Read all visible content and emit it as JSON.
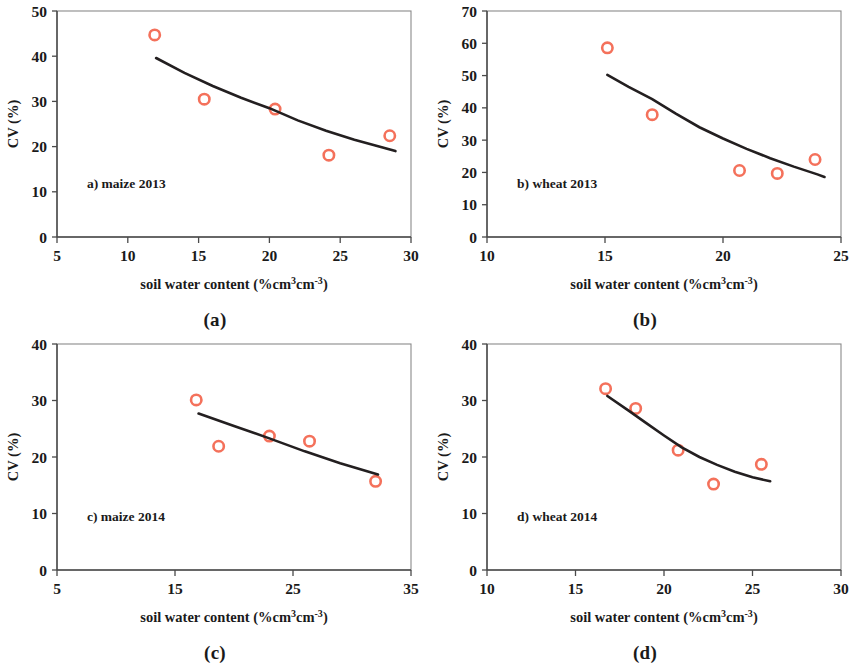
{
  "figure": {
    "marker_color": "#F4715B",
    "curve_color": "#231f20",
    "axis_color": "#4a4a4a",
    "frame_color": "#8a8a8a",
    "xlabel": "soil water content (%cm³cm⁻³)",
    "ylabel": "CV (%)"
  },
  "panels": [
    {
      "caption": "(a)",
      "tag": "a) maize 2013",
      "chart_data": {
        "type": "scatter",
        "title": "a) maize 2013",
        "xlabel": "soil water content (%cm³cm⁻³)",
        "ylabel": "CV (%)",
        "xlim": [
          5,
          30
        ],
        "ylim": [
          0,
          50
        ],
        "xticks": [
          5,
          10,
          15,
          20,
          25,
          30
        ],
        "yticks": [
          0,
          10,
          20,
          30,
          40,
          50
        ],
        "grid": false,
        "legend": "none",
        "series": [
          {
            "name": "maize 2013 observations",
            "marker": "open-circle",
            "color": "#F4715B",
            "points": [
              {
                "x": 11.9,
                "y": 44.7
              },
              {
                "x": 15.4,
                "y": 30.5
              },
              {
                "x": 20.4,
                "y": 28.3
              },
              {
                "x": 24.2,
                "y": 18.1
              },
              {
                "x": 28.5,
                "y": 22.4
              }
            ]
          },
          {
            "name": "fitted curve",
            "type": "line",
            "color": "#231f20",
            "points": [
              {
                "x": 12.0,
                "y": 39.6
              },
              {
                "x": 14.0,
                "y": 36.3
              },
              {
                "x": 16.0,
                "y": 33.4
              },
              {
                "x": 18.0,
                "y": 30.8
              },
              {
                "x": 20.0,
                "y": 28.5
              },
              {
                "x": 22.0,
                "y": 25.8
              },
              {
                "x": 24.0,
                "y": 23.5
              },
              {
                "x": 26.0,
                "y": 21.5
              },
              {
                "x": 28.0,
                "y": 19.8
              },
              {
                "x": 28.9,
                "y": 19.0
              }
            ]
          }
        ]
      }
    },
    {
      "caption": "(b)",
      "tag": "b) wheat 2013",
      "chart_data": {
        "type": "scatter",
        "title": "b) wheat 2013",
        "xlabel": "soil water content (%cm³cm⁻³)",
        "ylabel": "CV (%)",
        "xlim": [
          10,
          25
        ],
        "ylim": [
          0,
          70
        ],
        "xticks": [
          10,
          15,
          20,
          25
        ],
        "yticks": [
          0,
          10,
          20,
          30,
          40,
          50,
          60,
          70
        ],
        "grid": false,
        "legend": "none",
        "series": [
          {
            "name": "wheat 2013 observations",
            "marker": "open-circle",
            "color": "#F4715B",
            "points": [
              {
                "x": 15.1,
                "y": 58.6
              },
              {
                "x": 17.0,
                "y": 37.9
              },
              {
                "x": 20.7,
                "y": 20.6
              },
              {
                "x": 22.3,
                "y": 19.7
              },
              {
                "x": 23.9,
                "y": 24.0
              }
            ]
          },
          {
            "name": "fitted curve",
            "type": "line",
            "color": "#231f20",
            "points": [
              {
                "x": 15.1,
                "y": 50.2
              },
              {
                "x": 16.0,
                "y": 46.5
              },
              {
                "x": 17.0,
                "y": 42.7
              },
              {
                "x": 18.0,
                "y": 38.2
              },
              {
                "x": 19.0,
                "y": 34.0
              },
              {
                "x": 20.0,
                "y": 30.5
              },
              {
                "x": 21.0,
                "y": 27.3
              },
              {
                "x": 22.0,
                "y": 24.4
              },
              {
                "x": 23.0,
                "y": 21.8
              },
              {
                "x": 24.0,
                "y": 19.4
              },
              {
                "x": 24.3,
                "y": 18.6
              }
            ]
          }
        ]
      }
    },
    {
      "caption": "(c)",
      "tag": "c) maize 2014",
      "chart_data": {
        "type": "scatter",
        "title": "c) maize 2014",
        "xlabel": "soil water content (%cm³cm⁻³)",
        "ylabel": "CV (%)",
        "xlim": [
          5,
          35
        ],
        "ylim": [
          0,
          40
        ],
        "xticks": [
          5,
          15,
          25,
          35
        ],
        "yticks": [
          0,
          10,
          20,
          30,
          40
        ],
        "grid": false,
        "legend": "none",
        "series": [
          {
            "name": "maize 2014 observations",
            "marker": "open-circle",
            "color": "#F4715B",
            "points": [
              {
                "x": 16.8,
                "y": 30.1
              },
              {
                "x": 18.7,
                "y": 21.9
              },
              {
                "x": 23.0,
                "y": 23.7
              },
              {
                "x": 26.4,
                "y": 22.8
              },
              {
                "x": 32.0,
                "y": 15.7
              }
            ]
          },
          {
            "name": "fitted curve",
            "type": "line",
            "color": "#231f20",
            "points": [
              {
                "x": 17.0,
                "y": 27.7
              },
              {
                "x": 20.0,
                "y": 25.5
              },
              {
                "x": 23.0,
                "y": 23.3
              },
              {
                "x": 26.0,
                "y": 21.0
              },
              {
                "x": 29.0,
                "y": 18.9
              },
              {
                "x": 32.2,
                "y": 16.9
              }
            ]
          }
        ]
      }
    },
    {
      "caption": "(d)",
      "tag": "d) wheat 2014",
      "chart_data": {
        "type": "scatter",
        "title": "d) wheat 2014",
        "xlabel": "soil water content (%cm³cm⁻³)",
        "ylabel": "CV (%)",
        "xlim": [
          10,
          30
        ],
        "ylim": [
          0,
          40
        ],
        "xticks": [
          10,
          15,
          20,
          25,
          30
        ],
        "yticks": [
          0,
          10,
          20,
          30,
          40
        ],
        "grid": false,
        "legend": "none",
        "series": [
          {
            "name": "wheat 2014 observations",
            "marker": "open-circle",
            "color": "#F4715B",
            "points": [
              {
                "x": 16.7,
                "y": 32.1
              },
              {
                "x": 18.4,
                "y": 28.6
              },
              {
                "x": 20.8,
                "y": 21.2
              },
              {
                "x": 22.8,
                "y": 15.2
              },
              {
                "x": 25.5,
                "y": 18.7
              }
            ]
          },
          {
            "name": "fitted curve",
            "type": "line",
            "color": "#231f20",
            "points": [
              {
                "x": 16.8,
                "y": 30.8
              },
              {
                "x": 18.0,
                "y": 28.2
              },
              {
                "x": 19.0,
                "y": 26.0
              },
              {
                "x": 20.0,
                "y": 23.8
              },
              {
                "x": 21.0,
                "y": 21.7
              },
              {
                "x": 22.0,
                "y": 20.0
              },
              {
                "x": 23.0,
                "y": 18.6
              },
              {
                "x": 24.0,
                "y": 17.4
              },
              {
                "x": 25.0,
                "y": 16.4
              },
              {
                "x": 26.0,
                "y": 15.7
              }
            ]
          }
        ]
      }
    }
  ]
}
